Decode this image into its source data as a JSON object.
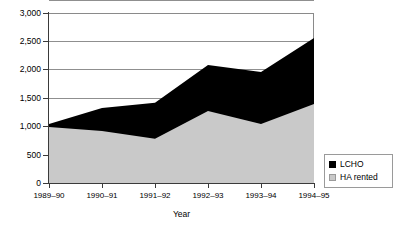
{
  "chart_data": {
    "type": "area",
    "stacked": true,
    "title": "",
    "xlabel": "Year",
    "ylabel": "",
    "categories": [
      "1989–90",
      "1990–91",
      "1991–92",
      "1992–93",
      "1993–94",
      "1994–95"
    ],
    "series": [
      {
        "name": "LCHO",
        "color": "#000000",
        "values": [
          50,
          405,
          635,
          815,
          920,
          1165
        ]
      },
      {
        "name": "HA rented",
        "color": "#c9c9c9",
        "values": [
          990,
          920,
          780,
          1270,
          1040,
          1395
        ]
      }
    ],
    "totals": [
      1040,
      1325,
      1415,
      2085,
      1960,
      2560
    ],
    "ylim": [
      0,
      3000
    ],
    "ytick_values": [
      0,
      500,
      1000,
      1500,
      2000,
      2500,
      3000
    ],
    "ytick_labels": [
      "0",
      "500",
      "1,000",
      "1,500",
      "2,000",
      "2,500",
      "3,000"
    ],
    "grid": true,
    "legend_position": "right"
  },
  "axes": {
    "y_labels": [
      "3,000",
      "2,500",
      "2,000",
      "1,500",
      "1,000",
      "500",
      "0"
    ],
    "x_labels": [
      "1989–90",
      "1990–91",
      "1991–92",
      "1992–93",
      "1993–94",
      "1994–95"
    ],
    "x_axis_title": "Year"
  },
  "legend": {
    "items": [
      {
        "label": "LCHO",
        "swatch": "black-swatch"
      },
      {
        "label": "HA rented",
        "swatch": "gray-swatch"
      }
    ]
  },
  "colors": {
    "lcho": "#000000",
    "ha_rented": "#c9c9c9",
    "grid": "#8f8f8f",
    "axis": "#3a3a3a",
    "background": "#ffffff"
  }
}
